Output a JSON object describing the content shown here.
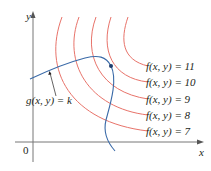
{
  "figure": {
    "type": "level-curves-with-constraint",
    "axes": {
      "x_label": "x",
      "y_label": "y",
      "origin_label": "0"
    },
    "level_curves": [
      {
        "label": "f(x, y) = 11",
        "value": 11
      },
      {
        "label": "f(x, y) = 10",
        "value": 10
      },
      {
        "label": "f(x, y) = 9",
        "value": 9
      },
      {
        "label": "f(x, y) = 8",
        "value": 8
      },
      {
        "label": "f(x, y) = 7",
        "value": 7
      }
    ],
    "constraint_curve": {
      "label": "g(x, y) = k"
    },
    "tangent_point": {
      "x": 111,
      "y": 66
    }
  },
  "colors": {
    "level_curve": "#e8736a",
    "constraint_curve": "#3a6aa8",
    "axes": "#555555",
    "text": "#231f20",
    "point": "#1e3d6e"
  }
}
